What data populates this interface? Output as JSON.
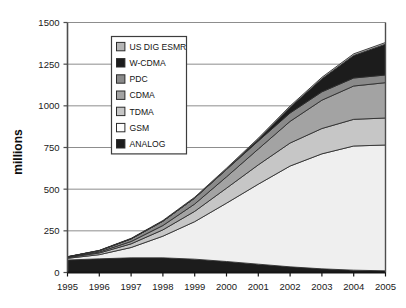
{
  "chart_data": {
    "type": "area",
    "stacked": true,
    "title": "",
    "xlabel": "",
    "ylabel": "millions",
    "categories": [
      "1995",
      "1996",
      "1997",
      "1998",
      "1999",
      "2000",
      "2001",
      "2002",
      "2003",
      "2004",
      "2005"
    ],
    "x": [
      1995,
      1996,
      1997,
      1998,
      1999,
      2000,
      2001,
      2002,
      2003,
      2004,
      2005
    ],
    "ylim": [
      0,
      1500
    ],
    "yticks": [
      0,
      250,
      500,
      750,
      1000,
      1250,
      1500
    ],
    "ytick_labels": [
      "0",
      "250",
      "500",
      "750",
      "1000",
      "1250",
      "1500"
    ],
    "grid": true,
    "grid_axis": "y",
    "legend_position": "inside-upper-left",
    "stack_order_bottom_to_top": [
      "ANALOG",
      "GSM",
      "TDMA",
      "CDMA",
      "PDC",
      "W-CDMA",
      "US DIG ESMR"
    ],
    "series": [
      {
        "name": "ANALOG",
        "color": "#1c1c1c",
        "values": [
          75,
          82,
          88,
          88,
          80,
          66,
          50,
          34,
          22,
          14,
          10
        ]
      },
      {
        "name": "GSM",
        "color": "#efefef",
        "values": [
          10,
          25,
          62,
          130,
          225,
          350,
          480,
          605,
          690,
          745,
          755
        ]
      },
      {
        "name": "TDMA",
        "color": "#c6c6c6",
        "values": [
          4,
          10,
          22,
          38,
          62,
          90,
          116,
          138,
          152,
          160,
          162
        ]
      },
      {
        "name": "CDMA",
        "color": "#a3a3a3",
        "values": [
          2,
          6,
          14,
          26,
          44,
          68,
          95,
          130,
          170,
          200,
          212
        ]
      },
      {
        "name": "PDC",
        "color": "#8a8a8a",
        "values": [
          3,
          8,
          16,
          26,
          36,
          44,
          48,
          50,
          50,
          48,
          46
        ]
      },
      {
        "name": "W-CDMA",
        "color": "#1c1c1c",
        "values": [
          0,
          0,
          0,
          0,
          0,
          2,
          10,
          34,
          78,
          135,
          185
        ]
      },
      {
        "name": "US DIG ESMR",
        "color": "#b5b5b5",
        "values": [
          1,
          2,
          3,
          4,
          5,
          6,
          7,
          8,
          9,
          10,
          10
        ]
      }
    ],
    "totals": [
      95,
      133,
      205,
      312,
      452,
      626,
      806,
      999,
      1171,
      1312,
      1380
    ]
  },
  "legend": {
    "items": [
      {
        "label": "US DIG ESMR",
        "color": "#b5b5b5"
      },
      {
        "label": "W-CDMA",
        "color": "#1c1c1c"
      },
      {
        "label": "PDC",
        "color": "#8a8a8a"
      },
      {
        "label": "CDMA",
        "color": "#a3a3a3"
      },
      {
        "label": "TDMA",
        "color": "#c6c6c6"
      },
      {
        "label": "GSM",
        "color": "#fdfdfd"
      },
      {
        "label": "ANALOG",
        "color": "#1c1c1c"
      }
    ]
  },
  "style": {
    "plot_background": "#ffffff",
    "axis_color": "#4d4d4d",
    "grid_color": "#808080",
    "band_outline": "#2b2b2b",
    "legend_border": "#3d3d3d",
    "text_color": "#1a1a1a"
  }
}
